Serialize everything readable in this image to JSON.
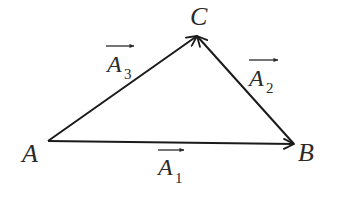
{
  "diagram": {
    "type": "vector-triangle",
    "stroke_color": "#1a1a1a",
    "text_color": "#2a2a2a",
    "background": "#ffffff",
    "vertices": [
      {
        "name": "A",
        "x": 48,
        "y": 141,
        "label_x": 22,
        "label_y": 162
      },
      {
        "name": "B",
        "x": 294,
        "y": 144,
        "label_x": 297,
        "label_y": 161
      },
      {
        "name": "C",
        "x": 197,
        "y": 36,
        "label_x": 190,
        "label_y": 26
      }
    ],
    "vectors": [
      {
        "name": "A1",
        "letter": "A",
        "subscript": "1",
        "from": "A",
        "to": "B",
        "label_x": 158,
        "label_y": 176,
        "bar_x1": 158,
        "bar_x2": 184,
        "bar_y": 150
      },
      {
        "name": "A2",
        "letter": "A",
        "subscript": "2",
        "from": "B",
        "to": "C",
        "label_x": 249,
        "label_y": 87,
        "bar_x1": 249,
        "bar_x2": 278,
        "bar_y": 60
      },
      {
        "name": "A3",
        "letter": "A",
        "subscript": "3",
        "from": "A",
        "to": "C",
        "label_x": 107,
        "label_y": 72,
        "bar_x1": 106,
        "bar_x2": 134,
        "bar_y": 46
      }
    ]
  },
  "labels": {
    "A": "A",
    "B": "B",
    "C": "C",
    "A1_letter": "A",
    "A1_sub": "1",
    "A2_letter": "A",
    "A2_sub": "2",
    "A3_letter": "A",
    "A3_sub": "3"
  }
}
